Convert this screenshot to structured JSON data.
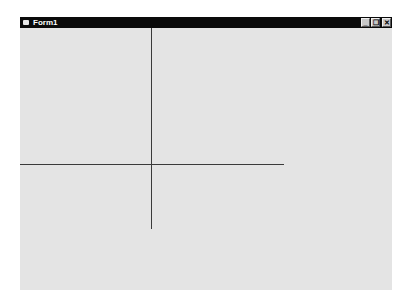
{
  "window": {
    "title": "Form1",
    "icon": "form-icon",
    "caption_buttons": [
      {
        "name": "minimize",
        "glyph": "_"
      },
      {
        "name": "restore",
        "glyph": "❐"
      },
      {
        "name": "close",
        "glyph": "✕"
      }
    ]
  },
  "canvas": {
    "background": "#e4e4e4",
    "line_color": "#3a3a3a",
    "lines": [
      {
        "orientation": "vertical",
        "x": 152,
        "y1": 28,
        "y2": 229
      },
      {
        "orientation": "horizontal",
        "y": 164,
        "x1": 21,
        "x2": 284
      }
    ]
  }
}
